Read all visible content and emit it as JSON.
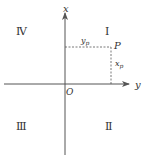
{
  "diagram": {
    "type": "coordinate-system",
    "axes": {
      "vertical": {
        "label": "x",
        "direction": "up"
      },
      "horizontal": {
        "label": "y",
        "direction": "right"
      },
      "origin_label": "O"
    },
    "quadrants": [
      {
        "id": "I",
        "label": "Ⅰ",
        "position": "top-right"
      },
      {
        "id": "II",
        "label": "Ⅱ",
        "position": "bottom-right"
      },
      {
        "id": "III",
        "label": "Ⅲ",
        "position": "bottom-left"
      },
      {
        "id": "IV",
        "label": "Ⅳ",
        "position": "top-left"
      }
    ],
    "point": {
      "label": "P",
      "y_label": "y",
      "y_sub": "p",
      "x_label": "x",
      "x_sub": "p"
    },
    "colors": {
      "line": "#555555",
      "text": "#333333",
      "background": "#ffffff"
    }
  }
}
